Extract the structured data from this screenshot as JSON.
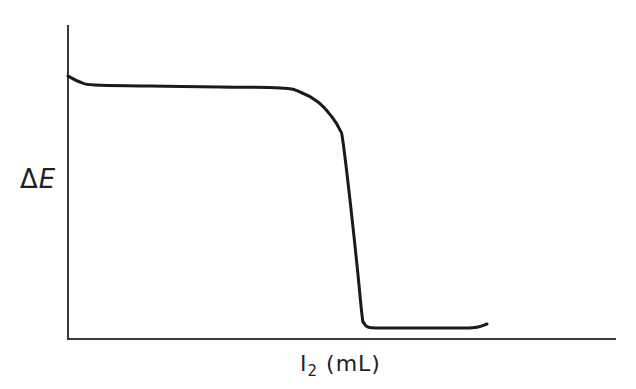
{
  "chart_data": {
    "type": "line",
    "title": "",
    "xlabel": "I2 (mL)",
    "ylabel": "ΔE",
    "x_ticks": [],
    "y_ticks": [],
    "grid": false,
    "legend": null,
    "series": [
      {
        "name": "titration curve",
        "color": "#1a1a1a",
        "points_px": [
          [
            68,
            76
          ],
          [
            80,
            82
          ],
          [
            95,
            85
          ],
          [
            150,
            86
          ],
          [
            220,
            87
          ],
          [
            280,
            88
          ],
          [
            300,
            92
          ],
          [
            318,
            102
          ],
          [
            332,
            117
          ],
          [
            340,
            130
          ],
          [
            343,
            142
          ],
          [
            350,
            200
          ],
          [
            357,
            265
          ],
          [
            362,
            315
          ],
          [
            364,
            323
          ],
          [
            368,
            327
          ],
          [
            380,
            328
          ],
          [
            430,
            328
          ],
          [
            465,
            328
          ],
          [
            478,
            327
          ],
          [
            487,
            324
          ]
        ],
        "description": "ΔE holds on a high plateau, then drops sharply near the equivalence point to a low plateau"
      }
    ],
    "axes_px": {
      "origin": [
        68,
        339
      ],
      "x_end": [
        616,
        339
      ],
      "y_top": [
        68,
        25
      ]
    }
  },
  "labels": {
    "y_delta": "Δ",
    "y_var": "E",
    "x_main": "I",
    "x_sub": "2",
    "x_unit": "(mL)"
  },
  "style": {
    "axis_color": "#3a3a3a",
    "curve_color": "#1a1a1a"
  }
}
